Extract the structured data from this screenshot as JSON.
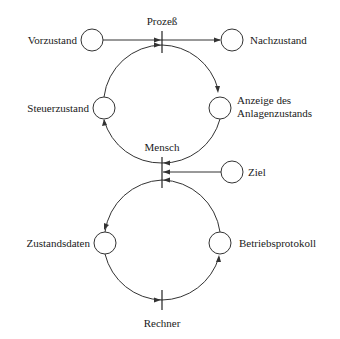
{
  "diagram": {
    "type": "petri-net",
    "transitions": [
      {
        "id": "prozess",
        "label": "Prozeß"
      },
      {
        "id": "mensch",
        "label": "Mensch"
      },
      {
        "id": "rechner",
        "label": "Rechner"
      }
    ],
    "places": [
      {
        "id": "vorzustand",
        "label": "Vorzustand"
      },
      {
        "id": "nachzustand",
        "label": "Nachzustand"
      },
      {
        "id": "steuerzustand",
        "label": "Steuerzustand"
      },
      {
        "id": "anzeige",
        "label_line1": "Anzeige des",
        "label_line2": "Anlagenzustands"
      },
      {
        "id": "ziel",
        "label": "Ziel"
      },
      {
        "id": "zustandsdaten",
        "label": "Zustandsdaten"
      },
      {
        "id": "betriebsprotokoll",
        "label": "Betriebsprotokoll"
      }
    ],
    "arcs": [
      {
        "from": "Vorzustand",
        "to": "Prozeß"
      },
      {
        "from": "Prozeß",
        "to": "Nachzustand"
      },
      {
        "from": "Prozeß",
        "to": "Anzeige des Anlagenzustands"
      },
      {
        "from": "Anzeige des Anlagenzustands",
        "to": "Mensch"
      },
      {
        "from": "Mensch",
        "to": "Steuerzustand"
      },
      {
        "from": "Steuerzustand",
        "to": "Prozeß"
      },
      {
        "from": "Ziel",
        "to": "Mensch"
      },
      {
        "from": "Mensch",
        "to": "Zustandsdaten"
      },
      {
        "from": "Zustandsdaten",
        "to": "Rechner"
      },
      {
        "from": "Rechner",
        "to": "Betriebsprotokoll"
      },
      {
        "from": "Betriebsprotokoll",
        "to": "Mensch"
      }
    ]
  }
}
